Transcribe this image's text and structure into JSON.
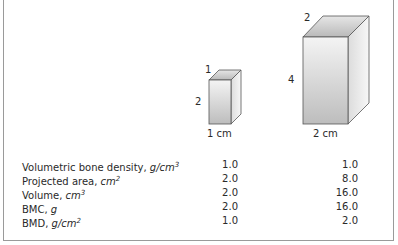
{
  "figure": {
    "small_box": {
      "top_label": "1",
      "side_label": "2",
      "bottom_label": "1 cm"
    },
    "large_box": {
      "top_label": "2",
      "side_label": "4",
      "bottom_label": "2 cm"
    }
  },
  "table": {
    "rows": [
      {
        "name": "Volumetric bone density, ",
        "unit": "g/cm",
        "exp": "3",
        "small": "1.0",
        "large": "1.0"
      },
      {
        "name": "Projected area, ",
        "unit": "cm",
        "exp": "2",
        "small": "2.0",
        "large": "8.0"
      },
      {
        "name": "Volume, ",
        "unit": "cm",
        "exp": "3",
        "small": "2.0",
        "large": "16.0"
      },
      {
        "name": "BMC, ",
        "unit": "g",
        "exp": "",
        "small": "2.0",
        "large": "16.0"
      },
      {
        "name": "BMD, ",
        "unit": "g/cm",
        "exp": "2",
        "small": "1.0",
        "large": "2.0"
      }
    ]
  }
}
